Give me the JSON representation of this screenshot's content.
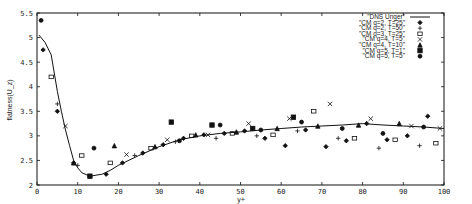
{
  "chart_data": {
    "type": "line",
    "title": "",
    "xlabel": "y+",
    "ylabel": "flatness(U_z)",
    "xlim": [
      0,
      100
    ],
    "ylim": [
      2,
      5.5
    ],
    "xticks": [
      0,
      10,
      20,
      30,
      40,
      50,
      60,
      70,
      80,
      90,
      100
    ],
    "yticks": [
      2,
      2.5,
      3,
      3.5,
      4,
      4.5,
      5,
      5.5
    ],
    "grid": false,
    "legend_position": "top-right",
    "series": [
      {
        "name": "\"DNS Unger\"",
        "style": "line",
        "x": [
          0.5,
          2,
          3.5,
          5,
          6,
          7,
          8,
          9,
          10,
          11,
          13,
          16,
          18,
          20,
          25,
          30,
          35,
          40,
          45,
          50,
          55,
          60,
          65,
          70,
          75,
          80,
          85,
          90,
          95,
          100
        ],
        "y": [
          5.05,
          4.9,
          4.65,
          3.9,
          3.5,
          3.12,
          2.8,
          2.5,
          2.35,
          2.25,
          2.18,
          2.22,
          2.3,
          2.4,
          2.6,
          2.78,
          2.92,
          3.0,
          3.05,
          3.08,
          3.12,
          3.15,
          3.18,
          3.2,
          3.22,
          3.25,
          3.22,
          3.2,
          3.18,
          3.15
        ]
      },
      {
        "name": "\"CM q=2, T=25\"",
        "marker": "diamond",
        "x": [
          1.5,
          5,
          9,
          13,
          17,
          21,
          26,
          31,
          36,
          41,
          46,
          51,
          56,
          61,
          66,
          71,
          76,
          81,
          86,
          91,
          96
        ],
        "y": [
          4.75,
          3.5,
          2.45,
          2.18,
          2.22,
          2.45,
          2.65,
          2.82,
          2.95,
          3.02,
          3.05,
          3.1,
          2.95,
          2.8,
          3.12,
          2.78,
          2.9,
          3.25,
          2.92,
          3.0,
          3.4
        ]
      },
      {
        "name": "\"CM q=2, T=50\"",
        "marker": "plus",
        "x": [
          5,
          10,
          24,
          34,
          44,
          54,
          64,
          74,
          84,
          94
        ],
        "y": [
          3.65,
          2.4,
          2.6,
          2.88,
          2.95,
          3.0,
          3.1,
          2.95,
          2.75,
          2.8
        ]
      },
      {
        "name": "\"CM q=3, T=25\"",
        "marker": "square",
        "x": [
          3.5,
          11,
          18,
          28,
          38,
          48,
          58,
          68,
          78,
          88,
          98
        ],
        "y": [
          4.2,
          2.6,
          2.45,
          2.75,
          3.0,
          3.05,
          3.02,
          3.5,
          2.95,
          2.92,
          2.85
        ]
      },
      {
        "name": "\"CM q=4, T=5\"",
        "marker": "x",
        "x": [
          7,
          22,
          32,
          42,
          52,
          62,
          72,
          82,
          92,
          99
        ],
        "y": [
          3.2,
          2.62,
          2.92,
          3.02,
          3.25,
          3.35,
          3.65,
          3.35,
          3.2,
          3.15
        ]
      },
      {
        "name": "\"CM q=4, T=10\"",
        "marker": "triangle",
        "x": [
          9,
          19,
          29,
          39,
          49,
          59,
          69,
          79,
          89
        ],
        "y": [
          2.45,
          2.8,
          2.78,
          3.02,
          3.08,
          3.15,
          3.2,
          3.22,
          3.25
        ]
      },
      {
        "name": "\"CM q=5, T=1\"",
        "marker": "filled-square",
        "x": [
          13,
          33,
          43,
          53,
          63
        ],
        "y": [
          2.18,
          3.28,
          3.22,
          3.15,
          3.38
        ]
      },
      {
        "name": "\"CM q=5, T=5\"",
        "marker": "circle",
        "x": [
          1,
          14,
          35,
          45,
          55,
          65,
          75,
          85,
          95
        ],
        "y": [
          5.35,
          2.75,
          2.9,
          3.22,
          3.12,
          3.28,
          3.15,
          3.05,
          3.18
        ]
      }
    ]
  }
}
